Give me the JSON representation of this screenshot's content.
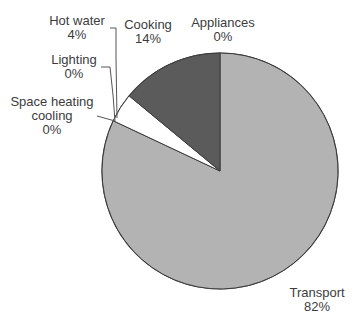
{
  "chart_data": {
    "type": "pie",
    "title": "",
    "start_angle_deg": 0,
    "direction": "clockwise",
    "center": [
      220,
      171
    ],
    "radius": 118,
    "slices": [
      {
        "name": "Transport",
        "label": "Transport",
        "pct_label": "82%",
        "value": 82,
        "color": "#b3b3b3"
      },
      {
        "name": "Space heating cooling",
        "label": "Space heating\ncooling",
        "pct_label": "0%",
        "value": 0,
        "color": "#ffffff"
      },
      {
        "name": "Lighting",
        "label": "Lighting",
        "pct_label": "0%",
        "value": 0,
        "color": "#ffffff"
      },
      {
        "name": "Hot water",
        "label": "Hot water",
        "pct_label": "4%",
        "value": 4,
        "color": "#ffffff"
      },
      {
        "name": "Cooking",
        "label": "Cooking",
        "pct_label": "14%",
        "value": 14,
        "color": "#5b5b5b"
      },
      {
        "name": "Appliances",
        "label": "Appliances",
        "pct_label": "0%",
        "value": 0,
        "color": "#ffffff"
      }
    ],
    "categories": [
      "Transport",
      "Space heating cooling",
      "Lighting",
      "Hot water",
      "Cooking",
      "Appliances"
    ],
    "values": [
      82,
      0,
      0,
      4,
      14,
      0
    ],
    "legend": "none (direct labels with leader lines)"
  },
  "labels": {
    "hot_water": {
      "name": "Hot water",
      "pct": "4%"
    },
    "cooking": {
      "name": "Cooking",
      "pct": "14%"
    },
    "appliances": {
      "name": "Appliances",
      "pct": "0%"
    },
    "lighting": {
      "name": "Lighting",
      "pct": "0%"
    },
    "space_heating": {
      "line1": "Space heating",
      "line2": "cooling",
      "pct": "0%"
    },
    "transport": {
      "name": "Transport",
      "pct": "82%"
    }
  },
  "colors": {
    "outline": "#3a3a3a",
    "leader": "#555555"
  }
}
